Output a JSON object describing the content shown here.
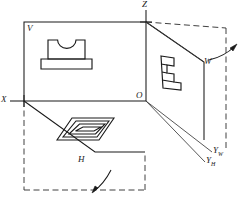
{
  "figure": {
    "domain_note": "three-projection-plane system, orthographic projection teaching figure",
    "labels": {
      "v_plane": "V",
      "h_plane": "H",
      "w_plane": "W",
      "origin": "O",
      "axis_x": "X",
      "axis_z": "Z",
      "axis_y_w_main": "Y",
      "axis_y_w_sub": "W",
      "axis_y_h_main": "Y",
      "axis_y_h_sub": "H"
    },
    "colors": {
      "line": "#1a1a1a",
      "thin_line": "#3a3a3a",
      "dashed_line": "#2b2b2b",
      "background": "#ffffff"
    },
    "planes": [
      {
        "name": "V",
        "role": "frontal projection plane",
        "view": "front view of part: pedestal with semicircular top notch"
      },
      {
        "name": "H",
        "role": "horizontal projection plane",
        "view": "top view of part: nested stepped rectangles"
      },
      {
        "name": "W",
        "role": "profile (side) projection plane",
        "view": "side view of part: stepped profile"
      }
    ],
    "axes": [
      {
        "id": "X",
        "description": "horizontal axis to the left, intersection of V and H"
      },
      {
        "id": "Z",
        "description": "vertical axis upward, intersection of V and W"
      },
      {
        "id": "YW",
        "description": "axis of W plane after rotation, to lower right"
      },
      {
        "id": "YH",
        "description": "axis of H plane after rotation, to lower right"
      }
    ],
    "annotations": [
      {
        "id": "h-rotation-arrow",
        "meaning": "H plane rotates downward about X axis"
      },
      {
        "id": "w-rotation-arrow",
        "meaning": "W plane rotates rightward about Z axis"
      },
      {
        "id": "h-unfolded-outline",
        "meaning": "dashed rectangle: H plane in unfolded position"
      },
      {
        "id": "w-unfolded-outline",
        "meaning": "dashed rectangle: W plane in unfolded position"
      }
    ]
  }
}
